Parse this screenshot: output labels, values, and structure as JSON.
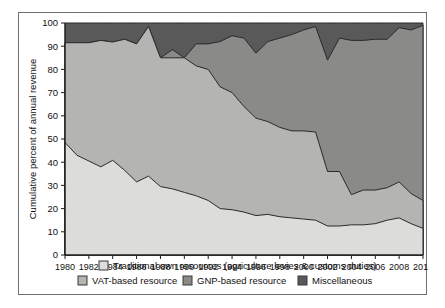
{
  "chart_data": {
    "type": "area",
    "stacked": true,
    "title": "",
    "xlabel": "",
    "ylabel": "Cumulative percent of annual revenue",
    "xlim": [
      1980,
      2010
    ],
    "ylim": [
      0,
      100
    ],
    "yticks": [
      0,
      10,
      20,
      30,
      40,
      50,
      60,
      70,
      80,
      90,
      100
    ],
    "xticks": [
      1980,
      1982,
      1984,
      1986,
      1988,
      1990,
      1992,
      1994,
      1996,
      1998,
      2000,
      2002,
      2004,
      2006,
      2008,
      2010
    ],
    "xtick_labels": [
      "1980",
      "1982",
      "1984",
      "1986",
      "1988",
      "1990",
      "1992",
      "1994",
      "1996",
      "1998",
      "2000",
      "2002",
      "2004",
      "2006",
      "2008",
      "2010"
    ],
    "ytick_labels": [
      "0",
      "10",
      "20",
      "30",
      "40",
      "50",
      "60",
      "70",
      "80",
      "90",
      "100"
    ],
    "grid": false,
    "legend_position": "bottom",
    "x": [
      1980,
      1981,
      1982,
      1983,
      1984,
      1985,
      1986,
      1987,
      1988,
      1989,
      1990,
      1991,
      1992,
      1993,
      1994,
      1995,
      1996,
      1997,
      1998,
      1999,
      2000,
      2001,
      2002,
      2003,
      2004,
      2005,
      2006,
      2007,
      2008,
      2009,
      2010
    ],
    "series": [
      {
        "name": "Traditional own resources (agriculture levies & customs duties)",
        "color": "#dcdcda",
        "values": [
          48.5,
          43.0,
          40.5,
          38.0,
          40.8,
          36.5,
          31.5,
          34.0,
          29.5,
          28.5,
          27.0,
          25.5,
          23.5,
          20.0,
          19.5,
          18.5,
          17.0,
          17.5,
          16.5,
          16.0,
          15.5,
          15.0,
          12.5,
          12.5,
          13.0,
          13.0,
          13.5,
          15.0,
          16.0,
          13.5,
          11.5
        ],
        "cumulative_top": [
          48.5,
          43.0,
          40.5,
          38.0,
          40.8,
          36.5,
          31.5,
          34.0,
          29.5,
          28.5,
          27.0,
          25.5,
          23.5,
          20.0,
          19.5,
          18.5,
          17.0,
          17.5,
          16.5,
          16.0,
          15.5,
          15.0,
          12.5,
          12.5,
          13.0,
          13.0,
          13.5,
          15.0,
          16.0,
          13.5,
          11.5
        ]
      },
      {
        "name": "VAT-based resource",
        "color": "#b4b4b2",
        "values": [
          43.0,
          48.5,
          51.0,
          54.5,
          51.0,
          56.5,
          59.5,
          64.5,
          55.5,
          56.5,
          58.0,
          56.0,
          56.5,
          52.5,
          50.5,
          45.5,
          42.0,
          40.0,
          38.5,
          37.5,
          38.0,
          38.0,
          23.5,
          23.5,
          13.0,
          15.0,
          14.5,
          14.0,
          15.5,
          13.0,
          12.0
        ],
        "cumulative_top": [
          91.5,
          91.5,
          91.5,
          92.5,
          91.8,
          93.0,
          91.0,
          98.5,
          85.0,
          85.0,
          85.0,
          81.5,
          80.0,
          72.5,
          70.0,
          64.0,
          59.0,
          57.5,
          55.0,
          53.5,
          53.5,
          53.0,
          36.0,
          36.0,
          26.0,
          28.0,
          28.0,
          29.0,
          31.5,
          26.5,
          23.5
        ]
      },
      {
        "name": "GNP-based resource",
        "color": "#8a8a88",
        "values": [
          0.0,
          0.0,
          0.0,
          0.0,
          0.0,
          0.0,
          0.0,
          0.0,
          0.0,
          3.5,
          0.0,
          9.5,
          11.0,
          19.5,
          24.5,
          29.5,
          28.0,
          34.5,
          38.5,
          41.5,
          43.5,
          45.5,
          48.0,
          57.5,
          66.5,
          64.5,
          65.0,
          64.0,
          66.5,
          70.5,
          75.5
        ],
        "cumulative_top": [
          91.5,
          91.5,
          91.5,
          92.5,
          91.8,
          93.0,
          91.0,
          98.5,
          85.0,
          88.5,
          85.0,
          91.0,
          91.0,
          92.0,
          94.5,
          93.5,
          87.0,
          92.0,
          93.5,
          95.0,
          97.0,
          98.5,
          84.0,
          93.5,
          92.5,
          92.5,
          93.0,
          93.0,
          98.0,
          97.0,
          99.0
        ]
      },
      {
        "name": "Miscellaneous",
        "color": "#59595a",
        "values": [
          8.5,
          8.5,
          8.5,
          7.5,
          8.2,
          7.0,
          9.0,
          1.5,
          15.0,
          11.5,
          15.0,
          9.0,
          9.0,
          8.0,
          5.5,
          6.5,
          13.0,
          8.0,
          6.5,
          5.0,
          3.0,
          1.5,
          16.0,
          6.5,
          7.5,
          7.5,
          7.0,
          7.0,
          2.0,
          3.0,
          1.0
        ],
        "cumulative_top": [
          100,
          100,
          100,
          100,
          100,
          100,
          100,
          100,
          100,
          100,
          100,
          100,
          100,
          100,
          100,
          100,
          100,
          100,
          100,
          100,
          100,
          100,
          100,
          100,
          100,
          100,
          100,
          100,
          100,
          100,
          100
        ]
      }
    ]
  },
  "legend": {
    "items": [
      {
        "label": "Traditional own resources (agriculture levies & customs duties)",
        "color": "#dcdcda"
      },
      {
        "label": "VAT-based resource",
        "color": "#b4b4b2"
      },
      {
        "label": "GNP-based resource",
        "color": "#8a8a88"
      },
      {
        "label": "Miscellaneous",
        "color": "#59595a"
      }
    ]
  },
  "axes": {
    "y_axis_title": "Cumulative percent of annual revenue"
  }
}
